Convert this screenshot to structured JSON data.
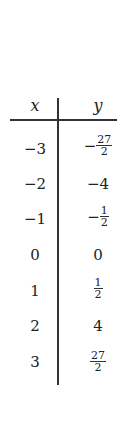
{
  "table": {
    "headers": {
      "x": "x",
      "y": "y"
    },
    "rows": [
      {
        "x": "−3",
        "y": {
          "sign": "−",
          "num": "27",
          "den": "2"
        }
      },
      {
        "x": "−2",
        "y": {
          "text": "−4"
        }
      },
      {
        "x": "−1",
        "y": {
          "sign": "−",
          "num": "1",
          "den": "2"
        }
      },
      {
        "x": "0",
        "y": {
          "text": "0"
        }
      },
      {
        "x": "1",
        "y": {
          "sign": "",
          "num": "1",
          "den": "2"
        }
      },
      {
        "x": "2",
        "y": {
          "text": "4"
        }
      },
      {
        "x": "3",
        "y": {
          "sign": "",
          "num": "27",
          "den": "2"
        }
      }
    ]
  }
}
